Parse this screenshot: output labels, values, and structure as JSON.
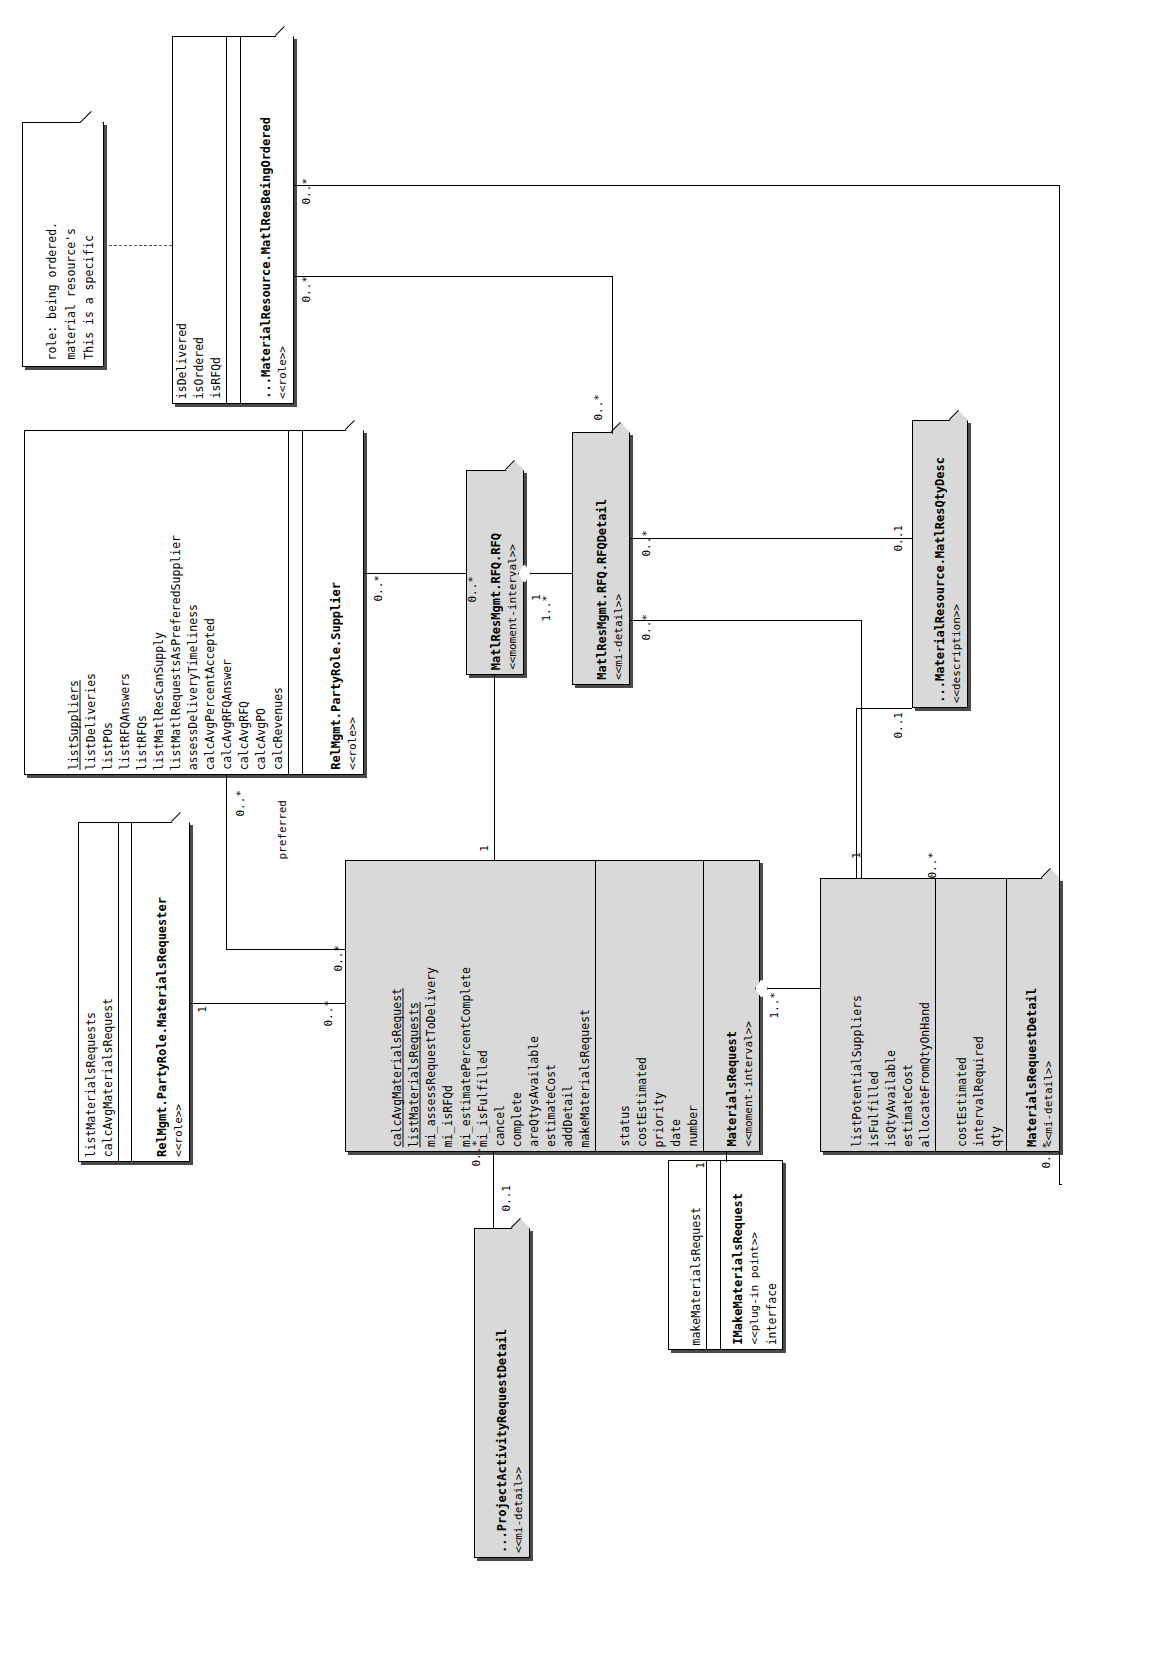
{
  "diagram": {
    "orientation": "rotated-90",
    "note": {
      "lines": [
        "This is a specific",
        "material resource's",
        "role: being ordered."
      ]
    },
    "classes": [
      {
        "id": "matlResBeingOrdered",
        "stereotype": "<<role>>",
        "name": "...MaterialResource.MatlResBeingOrdered",
        "shaded": false,
        "attributes": [
          "isRFQd",
          "isOrdered",
          "isDelivered"
        ],
        "operations": []
      },
      {
        "id": "supplier",
        "stereotype": "<<role>>",
        "name": "RelMgmt.PartyRole.Supplier",
        "shaded": false,
        "attributes": [],
        "operations": [
          "calcRevenues",
          "calcAvgPO",
          "calcAvgRFQ",
          "calcAvgRFQAnswer",
          "calcAvgPercentAccepted",
          "assessDeliveryTimeliness",
          "listMatlRequestsAsPreferedSupplier",
          "listMatlResCanSupply",
          "listRFQs",
          "listRFQAnswers",
          "listPOs",
          "listDeliveries",
          "listSuppliers"
        ],
        "underlined": [
          "listSuppliers"
        ]
      },
      {
        "id": "rfq",
        "stereotype": "<<moment-interval>>",
        "name": "MatlResMgmt.RFQ.RFQ",
        "shaded": true,
        "attributes": [],
        "operations": []
      },
      {
        "id": "rfqDetail",
        "stereotype": "<<mi-detail>>",
        "name": "MatlResMgmt.RFQ.RFQDetail",
        "shaded": true,
        "attributes": [],
        "operations": []
      },
      {
        "id": "matlResQtyDesc",
        "stereotype": "<<description>>",
        "name": "...MaterialResource.MatlResQtyDesc",
        "shaded": true,
        "attributes": [],
        "operations": []
      },
      {
        "id": "materialsRequester",
        "stereotype": "<<role>>",
        "name": "RelMgmt.PartyRole.MaterialsRequester",
        "shaded": false,
        "attributes": [],
        "operations": [
          "calcAvgMaterialsRequest",
          "listMaterialsRequests"
        ]
      },
      {
        "id": "materialsRequest",
        "stereotype": "<<moment-interval>>",
        "name": "MaterialsRequest",
        "shaded": true,
        "attributes": [
          "number",
          "date",
          "priority",
          "costEstimated",
          "status"
        ],
        "operations": [
          "makeMaterialsRequest",
          "addDetail",
          "estimateCost",
          "areQtysAvailable",
          "complete",
          "cancel",
          "mi_isFulfilled",
          "mi_estimatePercentComplete",
          "mi_isRFQd",
          "mi_assessRequestToDelivery",
          "listMaterialsRequests",
          "calcAvgMaterialsRequest"
        ],
        "underlined": [
          "listMaterialsRequests",
          "calcAvgMaterialsRequest"
        ]
      },
      {
        "id": "materialsRequestDetail",
        "stereotype": "<<mi-detail>>",
        "name": "MaterialsRequestDetail",
        "shaded": true,
        "attributes": [
          "qty",
          "intervalRequired",
          "costEstimated"
        ],
        "operations": [
          "allocateFromQtyOnHand",
          "estimateCost",
          "isQtyAvailable",
          "isFulfilled",
          "listPotentialSuppliers"
        ]
      },
      {
        "id": "makeMaterialsRequestInterface",
        "stereotype": "<<plug-in point>>",
        "kindLabel": "interface",
        "name": "IMakeMaterialsRequest",
        "shaded": false,
        "attributes": [],
        "operations": [
          "makeMaterialsRequest"
        ]
      },
      {
        "id": "projectActivityRequestDetail",
        "stereotype": "<<mi-detail>>",
        "name": "...ProjectActivityRequestDetail",
        "shaded": true,
        "attributes": [],
        "operations": []
      }
    ],
    "multiplicities": {
      "m1": "0..*",
      "m2": "0..*",
      "m3": "0..*",
      "m4": "0..*",
      "m5": "1",
      "m6": "1..*",
      "m7": "0..*",
      "m8": "0..1",
      "m9": "0..*",
      "m10": "0..1",
      "m11": "1",
      "m12": "0..*",
      "m13": "1",
      "m14": "1..*",
      "m15": "0..*",
      "m16": "1",
      "m17": "0..*",
      "m18": "0..*",
      "m19": "0..1",
      "m20": "1",
      "m21": "0..*",
      "m22": "0..*",
      "m23": "0..*"
    },
    "roleLabels": {
      "preferred": "preferred"
    },
    "colors": {
      "shaded_fill": "#d9d9d9",
      "plain_fill": "#ffffff",
      "stroke": "#000000",
      "shadow": "#4a4a4a"
    }
  }
}
